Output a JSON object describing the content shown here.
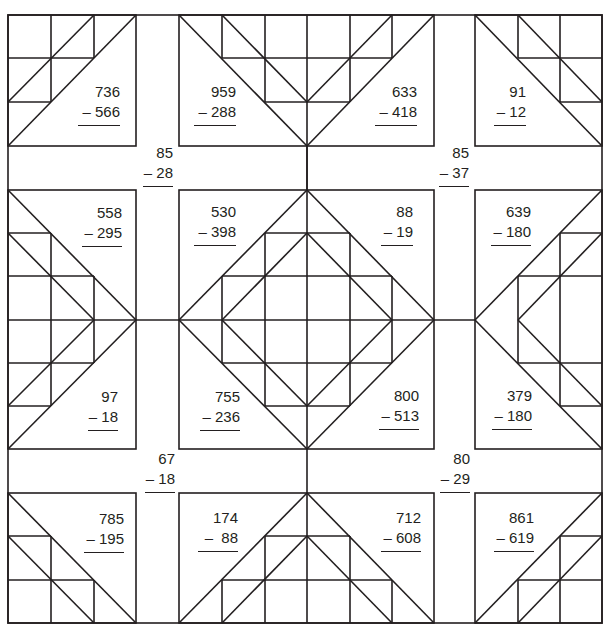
{
  "worksheet": {
    "type": "quilt-pattern subtraction worksheet",
    "line_color": "#231f20",
    "problems": [
      {
        "id": "p1",
        "top": "736",
        "bottom": "– 566"
      },
      {
        "id": "p2",
        "top": "959",
        "bottom": "– 288"
      },
      {
        "id": "p3",
        "top": "633",
        "bottom": "– 418"
      },
      {
        "id": "p4",
        "top": "91",
        "bottom": "– 12"
      },
      {
        "id": "p5",
        "top": "85",
        "bottom": "– 28"
      },
      {
        "id": "p6",
        "top": "85",
        "bottom": "– 37"
      },
      {
        "id": "p7",
        "top": "558",
        "bottom": "– 295"
      },
      {
        "id": "p8",
        "top": "530",
        "bottom": "– 398"
      },
      {
        "id": "p9",
        "top": "88",
        "bottom": "– 19"
      },
      {
        "id": "p10",
        "top": "639",
        "bottom": "– 180"
      },
      {
        "id": "p11",
        "top": "97",
        "bottom": "– 18"
      },
      {
        "id": "p12",
        "top": "755",
        "bottom": "– 236"
      },
      {
        "id": "p13",
        "top": "800",
        "bottom": "– 513"
      },
      {
        "id": "p14",
        "top": "379",
        "bottom": "– 180"
      },
      {
        "id": "p15",
        "top": "67",
        "bottom": "– 18"
      },
      {
        "id": "p16",
        "top": "80",
        "bottom": "– 29"
      },
      {
        "id": "p17",
        "top": "785",
        "bottom": "– 195"
      },
      {
        "id": "p18",
        "top": "174",
        "bottom": "–  88"
      },
      {
        "id": "p19",
        "top": "712",
        "bottom": "– 608"
      },
      {
        "id": "p20",
        "top": "861",
        "bottom": "– 619"
      }
    ]
  }
}
